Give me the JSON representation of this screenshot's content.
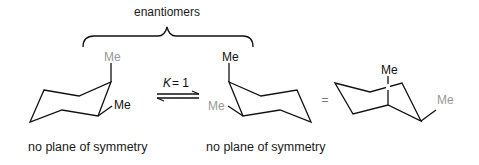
{
  "title_label": "enantiomers",
  "equilibrium": {
    "constant_symbol": "K",
    "constant_text": " = 1"
  },
  "equals_sign": "=",
  "structures": [
    {
      "id": "left-chair",
      "substituents": [
        {
          "label": "Me",
          "color": "#999999",
          "position": "axial-up"
        },
        {
          "label": "Me",
          "color": "#111111",
          "position": "equatorial"
        }
      ],
      "caption": "no plane of symmetry"
    },
    {
      "id": "middle-chair",
      "substituents": [
        {
          "label": "Me",
          "color": "#111111",
          "position": "axial-up"
        },
        {
          "label": "Me",
          "color": "#999999",
          "position": "equatorial"
        }
      ],
      "caption": "no plane of symmetry"
    },
    {
      "id": "right-chair",
      "substituents": [
        {
          "label": "Me",
          "color": "#111111",
          "position": "axial-up"
        },
        {
          "label": "Me",
          "color": "#999999",
          "position": "equatorial"
        }
      ]
    }
  ],
  "colors": {
    "ink": "#111111",
    "gray_substituent": "#999999"
  }
}
